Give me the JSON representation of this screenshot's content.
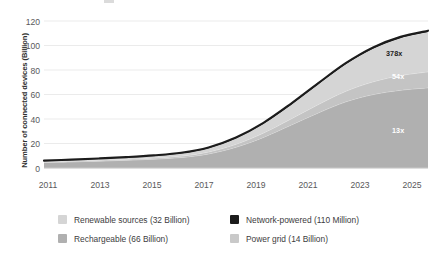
{
  "chart_data": {
    "type": "area",
    "stacked": true,
    "title": "",
    "subtitle": "",
    "xlabel": "",
    "ylabel": "Number of connected devices (Billion)",
    "x": [
      2011,
      2012,
      2013,
      2014,
      2015,
      2016,
      2017,
      2018,
      2019,
      2020,
      2021,
      2022,
      2023,
      2024,
      2025
    ],
    "xlim": [
      2011,
      2025
    ],
    "ylim": [
      0,
      120
    ],
    "xticks": [
      "2011",
      "2013",
      "2015",
      "2017",
      "2019",
      "2021",
      "2023",
      "2025"
    ],
    "yticks": [
      "0",
      "20",
      "40",
      "60",
      "80",
      "100",
      "120"
    ],
    "grid": true,
    "legend_position": "bottom",
    "series": [
      {
        "name": "Rechargeable (66 Billion)",
        "label": "Rechargeable",
        "value_label": "66 Billion",
        "color": "#b0b0b0",
        "values": [
          4.5,
          5.0,
          5.6,
          6.3,
          7.2,
          8.6,
          11.5,
          17.0,
          25.0,
          35.0,
          45.0,
          54.0,
          60.0,
          63.5,
          65.5
        ]
      },
      {
        "name": "Power grid (14 Billion)",
        "label": "Power grid",
        "value_label": "14 Billion",
        "color": "#c4c4c4",
        "values": [
          0.5,
          0.6,
          0.7,
          0.8,
          0.9,
          1.1,
          1.6,
          2.4,
          3.5,
          5.0,
          6.8,
          8.6,
          10.4,
          12.0,
          13.0
        ]
      },
      {
        "name": "Renewable sources (32 Billion)",
        "label": "Renewable sources",
        "value_label": "32 Billion",
        "color": "#d5d5d5",
        "values": [
          0.7,
          0.9,
          1.1,
          1.4,
          1.7,
          2.2,
          3.1,
          4.8,
          7.6,
          11.5,
          16.5,
          22.0,
          27.0,
          30.5,
          32.5
        ]
      },
      {
        "name": "Network-powered (110 Million)",
        "label": "Network-powered",
        "value_label": "110 Million",
        "color": "#1c1c1c",
        "values": [
          0.3,
          0.3,
          0.4,
          0.4,
          0.5,
          0.5,
          0.6,
          0.7,
          0.8,
          0.9,
          1.0,
          1.0,
          1.1,
          1.1,
          1.1
        ]
      }
    ],
    "totals": [
      6.0,
      6.8,
      7.8,
      8.9,
      10.3,
      12.4,
      16.8,
      24.9,
      36.9,
      52.4,
      69.3,
      85.6,
      98.5,
      107.1,
      112.1
    ],
    "annotations": [
      {
        "text": "378x",
        "x": 2024.1,
        "y": 90.0,
        "color": "#1c1c1c",
        "style": "dark"
      },
      {
        "text": "54x",
        "x": 2024.1,
        "y": 72.0,
        "color": "#ffffff",
        "style": "light"
      },
      {
        "text": "13x",
        "x": 2024.1,
        "y": 38.0,
        "color": "#ffffff",
        "style": "light"
      }
    ]
  },
  "legend": {
    "items": [
      {
        "label": "Renewable sources (32 Billion)",
        "color": "#d5d5d5",
        "swatch": "legend-swatch-renewable"
      },
      {
        "label": "Network-powered (110 Million)",
        "color": "#1c1c1c",
        "swatch": "legend-swatch-network"
      },
      {
        "label": "Rechargeable (66 Billion)",
        "color": "#b0b0b0",
        "swatch": "legend-swatch-rechargeable"
      },
      {
        "label": "Power grid (14 Billion)",
        "color": "#c9c9c9",
        "swatch": "legend-swatch-powergrid"
      }
    ]
  }
}
